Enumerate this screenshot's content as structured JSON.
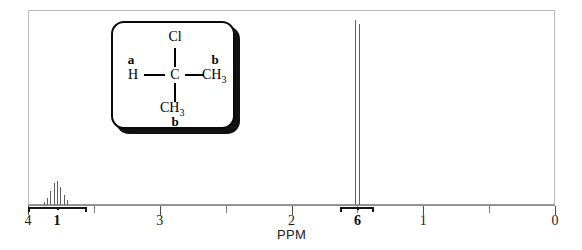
{
  "figure": {
    "axis_label": "PPM"
  },
  "axis": {
    "ticks": [
      {
        "value": "4",
        "ppm": 4,
        "major": true
      },
      {
        "value": "3",
        "ppm": 3,
        "major": true
      },
      {
        "value": "2",
        "ppm": 2,
        "major": true
      },
      {
        "value": "1",
        "ppm": 1,
        "major": true
      },
      {
        "value": "0",
        "ppm": 0,
        "major": true
      }
    ],
    "minor_ppm": [
      3.5,
      2.5,
      1.5,
      0.5
    ],
    "range": [
      4,
      0
    ],
    "units": "PPM"
  },
  "integrations": [
    {
      "label": "1",
      "ppm_start": 4.0,
      "ppm_end": 3.55,
      "center_ppm": 3.78
    },
    {
      "label": "6",
      "ppm_start": 1.63,
      "ppm_end": 1.37,
      "center_ppm": 1.5
    }
  ],
  "structure": {
    "box_label": "2-chloropropane",
    "atoms": {
      "cl": "Cl",
      "h": "H",
      "c": "C",
      "ch3_right": "CH",
      "ch3_right_sub": "3",
      "ch3_bottom": "CH",
      "ch3_bottom_sub": "3"
    },
    "proton_labels": {
      "a": "a",
      "b_right": "b",
      "b_bottom": "b"
    }
  },
  "colors": {
    "trace": "#5f5f5f",
    "frame": "#b9b9b9",
    "axis": "#8d8d8d",
    "text": "#0d0d0d",
    "structure_line": "#000000",
    "shadow": "#111111"
  },
  "chart_data": {
    "type": "line",
    "xlabel": "PPM",
    "ylabel": "",
    "xlim": [
      4,
      0
    ],
    "ylim": [
      0,
      100
    ],
    "grid": false,
    "legend": "none",
    "axis_direction": "reversed",
    "signals": [
      {
        "assignment": "a",
        "group": "CH (methine)",
        "multiplicity": "septet",
        "center_ppm": 3.78,
        "integration": 1,
        "relative_height": 13,
        "lines_ppm": [
          3.88,
          3.855,
          3.83,
          3.805,
          3.78,
          3.755,
          3.73,
          3.705
        ],
        "line_heights": [
          2,
          4,
          8,
          12,
          13,
          10,
          6,
          3
        ]
      },
      {
        "assignment": "b",
        "group": "2 x CH3 (methyl)",
        "multiplicity": "doublet",
        "center_ppm": 1.5,
        "integration": 6,
        "relative_height": 98,
        "lines_ppm": [
          1.515,
          1.488
        ],
        "line_heights": [
          98,
          96
        ]
      }
    ],
    "baseline": 0
  }
}
